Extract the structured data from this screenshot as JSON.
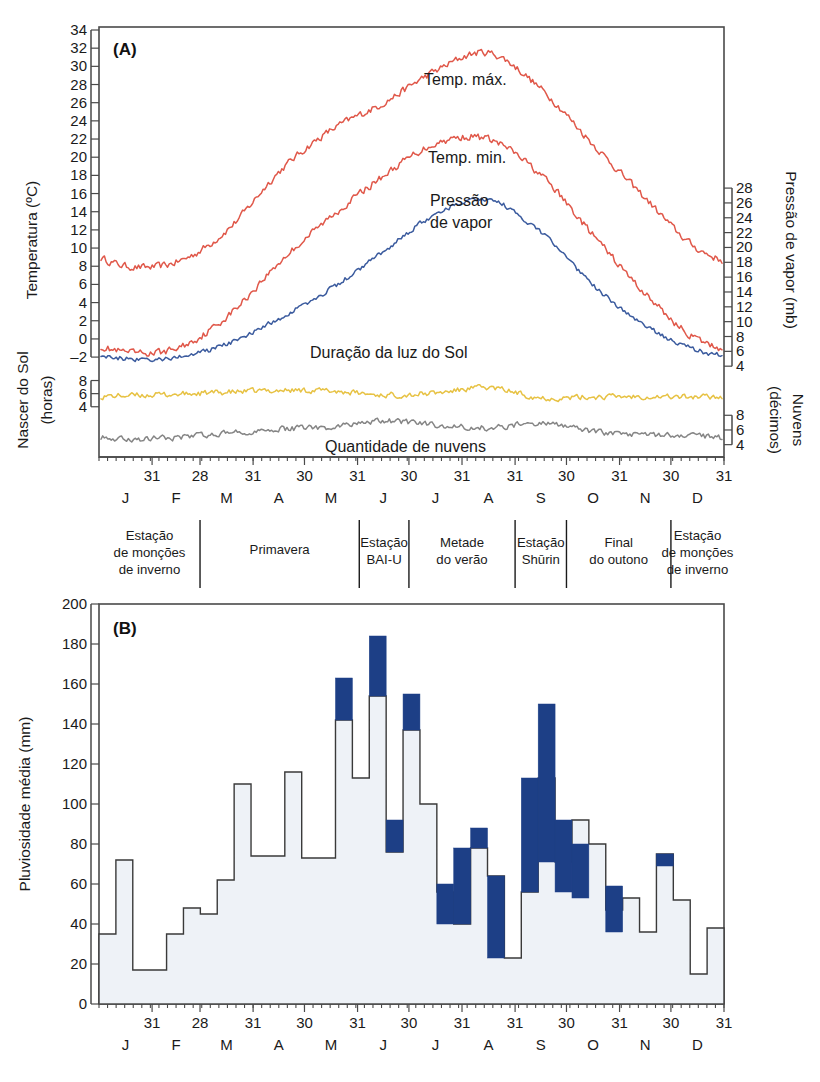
{
  "figure": {
    "panel_a_tag": "(A)",
    "panel_b_tag": "(B)"
  },
  "panel_a": {
    "axis_left_title": "Temperatura (ºC)",
    "axis_left_lower_title_1": "Nascer do Sol",
    "axis_left_lower_title_2": "(horas)",
    "axis_right_title": "Pressão de vapor (mb)",
    "axis_right_lower_title_1": "Nuvens",
    "axis_right_lower_title_2": "(décimos)",
    "annotations": {
      "tmax": "Temp. máx.",
      "tmin": "Temp. min.",
      "vapor_1": "Pressão",
      "vapor_2": "de vapor",
      "sunshine": "Duração da luz do Sol",
      "cloud": "Quantidade de nuvens"
    },
    "colors": {
      "temperature": "#e0584a",
      "vapor_pressure": "#3b5b9e",
      "sunshine": "#e7c244",
      "cloud": "#858585"
    }
  },
  "panel_b": {
    "axis_left_title": "Pluviosidade média (mm)",
    "colors": {
      "bar_fill": "#eef2f7",
      "bar_outline": "#3a3a3a",
      "blue_band": "#1d3f86"
    }
  },
  "months": {
    "letters": [
      "J",
      "F",
      "M",
      "A",
      "M",
      "J",
      "J",
      "A",
      "S",
      "O",
      "N",
      "D"
    ],
    "day_counts": [
      "31",
      "28",
      "31",
      "30",
      "31",
      "30",
      "31",
      "31",
      "30",
      "31",
      "30",
      "31"
    ]
  },
  "seasons": [
    {
      "lines": [
        "Estação",
        "de monções",
        "de inverno"
      ]
    },
    {
      "lines": [
        "Primavera"
      ]
    },
    {
      "lines": [
        "Estação",
        "BAI-U"
      ]
    },
    {
      "lines": [
        "Metade",
        "do verão"
      ]
    },
    {
      "lines": [
        "Estação",
        "Shūrin"
      ]
    },
    {
      "lines": [
        "Final",
        "do outono"
      ]
    },
    {
      "lines": [
        "Estação",
        "de monções",
        "de inverno"
      ]
    }
  ],
  "chart_data": [
    {
      "type": "line",
      "title": "(A) Ciclo anual de temperatura, pressão de vapor, luz do Sol e nuvens",
      "xlabel": "",
      "ylabel": "Temperatura (ºC)",
      "y2label": "Pressão de vapor (mb)",
      "ylim": [
        -4,
        34
      ],
      "yticks": [
        -2,
        0,
        2,
        4,
        6,
        8,
        10,
        12,
        14,
        16,
        18,
        20,
        22,
        24,
        26,
        28,
        30,
        32,
        34
      ],
      "y2ticks": [
        4,
        6,
        8,
        10,
        12,
        14,
        16,
        18,
        20,
        22,
        24,
        26,
        28
      ],
      "sun_yticks": [
        4,
        6,
        8
      ],
      "cloud_yticks": [
        4,
        6,
        8
      ],
      "grid": false,
      "legend": "in-plot annotations",
      "x": [
        "Jan",
        "Feb",
        "Mar",
        "Apr",
        "May",
        "Jun",
        "Jul",
        "Aug",
        "Sep",
        "Oct",
        "Nov",
        "Dec"
      ],
      "series": [
        {
          "name": "Temp. máx.",
          "unit": "ºC",
          "color": "#e0584a",
          "monthly_values": [
            8.0,
            8.5,
            12.0,
            18.5,
            23.0,
            26.0,
            29.5,
            31.5,
            27.5,
            21.5,
            15.5,
            10.0
          ]
        },
        {
          "name": "Temp. min.",
          "unit": "ºC",
          "color": "#e0584a",
          "monthly_values": [
            -1.5,
            -1.0,
            2.5,
            8.5,
            13.5,
            18.0,
            21.5,
            22.0,
            18.0,
            11.5,
            5.0,
            0.0
          ]
        },
        {
          "name": "Pressão de vapor",
          "unit": "mb",
          "color": "#3b5b9e",
          "monthly_values": [
            5.0,
            5.2,
            7.0,
            10.5,
            14.5,
            19.5,
            24.5,
            26.5,
            22.0,
            15.0,
            9.5,
            6.2
          ]
        },
        {
          "name": "Duração da luz do Sol",
          "unit": "horas",
          "color": "#e7c244",
          "monthly_values": [
            5.7,
            5.9,
            6.2,
            6.5,
            6.4,
            5.8,
            6.1,
            6.9,
            5.4,
            5.5,
            5.6,
            5.5
          ]
        },
        {
          "name": "Quantidade de nuvens",
          "unit": "décimos",
          "color": "#858585",
          "monthly_values": [
            4.7,
            5.0,
            5.6,
            6.1,
            6.4,
            7.2,
            6.7,
            6.3,
            6.9,
            5.8,
            5.3,
            5.2
          ]
        }
      ]
    },
    {
      "type": "bar",
      "title": "(B) Pluviosidade média por pêntada",
      "xlabel": "",
      "ylabel": "Pluviosidade média (mm)",
      "ylim": [
        0,
        200
      ],
      "yticks": [
        0,
        20,
        40,
        60,
        80,
        100,
        120,
        140,
        160,
        180,
        200
      ],
      "grid": false,
      "categories": [
        "J",
        "F",
        "M",
        "A",
        "M",
        "J",
        "J",
        "A",
        "S",
        "O",
        "N",
        "D"
      ],
      "bin": "pentad (5-day)",
      "note": "Caixas azuis indicam variabilidade/contribuição destacada.",
      "values": [
        35,
        72,
        17,
        17,
        35,
        48,
        45,
        62,
        110,
        74,
        74,
        116,
        73,
        73,
        142,
        113,
        154,
        76,
        137,
        100,
        56,
        40,
        78,
        64,
        23,
        56,
        113,
        71,
        92,
        80,
        47,
        53,
        36,
        75,
        52,
        15,
        38
      ],
      "blue_bands": [
        {
          "index": 14,
          "from": 142,
          "to": 163
        },
        {
          "index": 16,
          "from": 154,
          "to": 184
        },
        {
          "index": 17,
          "from": 76,
          "to": 92
        },
        {
          "index": 18,
          "from": 137,
          "to": 155
        },
        {
          "index": 20,
          "from": 40,
          "to": 60
        },
        {
          "index": 21,
          "from": 40,
          "to": 78
        },
        {
          "index": 22,
          "from": 78,
          "to": 88
        },
        {
          "index": 23,
          "from": 23,
          "to": 64
        },
        {
          "index": 25,
          "from": 56,
          "to": 113
        },
        {
          "index": 26,
          "from": 71,
          "to": 150
        },
        {
          "index": 27,
          "from": 56,
          "to": 92
        },
        {
          "index": 28,
          "from": 53,
          "to": 80
        },
        {
          "index": 30,
          "from": 36,
          "to": 59
        },
        {
          "index": 33,
          "from": 69,
          "to": 75
        }
      ]
    }
  ]
}
